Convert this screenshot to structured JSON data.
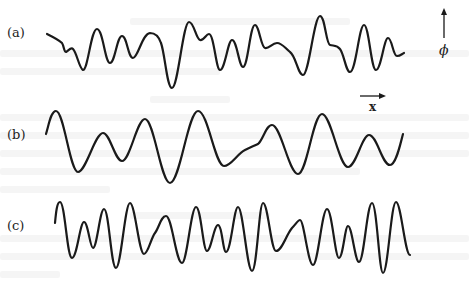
{
  "figure": {
    "panels": [
      {
        "label": "(a)",
        "description": "irregular wave profile with mixed wavelengths"
      },
      {
        "label": "(b)",
        "description": "smoother wave profile with longer wavelengths"
      },
      {
        "label": "(c)",
        "description": "wave profile with shorter wavelengths"
      }
    ],
    "axes": {
      "vertical_symbol": "ϕ",
      "horizontal_symbol": "x"
    },
    "colors": {
      "ink": "#1a1a1a",
      "paper": "#ffffff",
      "bleed_through": "#eeeeee"
    }
  }
}
